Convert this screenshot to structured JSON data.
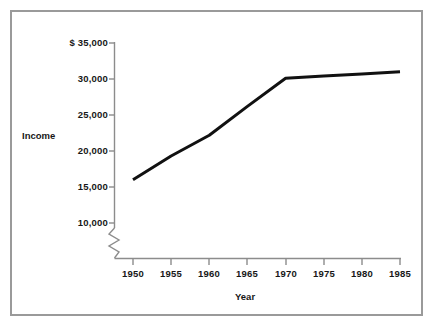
{
  "chart_data": {
    "type": "line",
    "title": "",
    "subtitle": "",
    "xlabel": "Year",
    "ylabel": "Income",
    "x": [
      1950,
      1955,
      1960,
      1965,
      1970,
      1975,
      1980,
      1985
    ],
    "xtick_labels": [
      "1950",
      "1955",
      "1960",
      "1965",
      "1970",
      "1975",
      "1980",
      "1985"
    ],
    "ytick_labels": [
      "$ 35,000",
      "30,000",
      "25,000",
      "20,000",
      "15,000",
      "10,000"
    ],
    "ytick_values": [
      35000,
      30000,
      25000,
      20000,
      15000,
      10000
    ],
    "ylim": [
      10000,
      35000
    ],
    "xlim": [
      1950,
      1985
    ],
    "grid": false,
    "legend": null,
    "axis_break": true,
    "axis_break_note": "zigzag break on y-axis below 10,000",
    "series": [
      {
        "name": "Income",
        "color": "#111111",
        "line_width": 3,
        "values": [
          16000,
          19300,
          22200,
          26200,
          30100,
          30400,
          30700,
          31000
        ]
      }
    ]
  },
  "axes": {
    "y_axis_name": "income-axis",
    "x_axis_name": "year-axis",
    "currency_prefix": "$"
  },
  "style": {
    "frame_color": "#9a9a9a",
    "axis_color": "#8c8c8c",
    "line_color": "#111111",
    "background": "#ffffff",
    "text_color": "#171717"
  }
}
